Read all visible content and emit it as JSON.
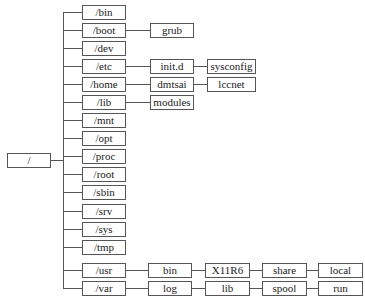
{
  "diagram": {
    "type": "directory-tree",
    "root": "/",
    "level1": [
      "/bin",
      "/boot",
      "/dev",
      "/etc",
      "/home",
      "/lib",
      "/mnt",
      "/opt",
      "/proc",
      "/root",
      "/sbin",
      "/srv",
      "/sys",
      "/tmp",
      "/usr",
      "/var"
    ],
    "children": {
      "boot": [
        "grub"
      ],
      "etc": [
        "init.d",
        "sysconfig"
      ],
      "home": [
        "dmtsai",
        "lccnet"
      ],
      "lib": [
        "modules"
      ],
      "usr": [
        "bin",
        "X11R6",
        "share",
        "local"
      ],
      "var": [
        "log",
        "lib",
        "spool",
        "run"
      ]
    }
  }
}
